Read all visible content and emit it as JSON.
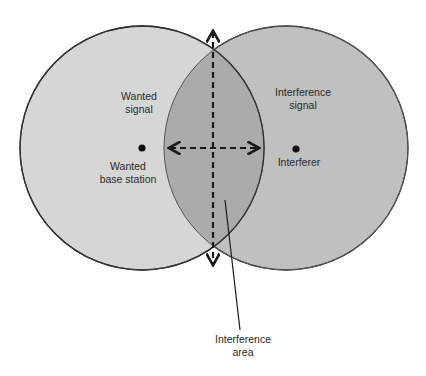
{
  "diagram": {
    "colors": {
      "wanted_fill": "#d6d6d6",
      "interferer_fill": "#bdbdbd",
      "overlap_fill": "#a9a9a9",
      "stroke": "#333333",
      "arrow": "#1a1a1a"
    },
    "left_circle": {
      "region_label_line1": "Wanted",
      "region_label_line2": "signal",
      "node_label_line1": "Wanted",
      "node_label_line2": "base station"
    },
    "right_circle": {
      "region_label_line1": "Interference",
      "region_label_line2": "signal",
      "node_label": "Interferer"
    },
    "overlap": {
      "callout_line1": "Interference",
      "callout_line2": "area"
    }
  }
}
